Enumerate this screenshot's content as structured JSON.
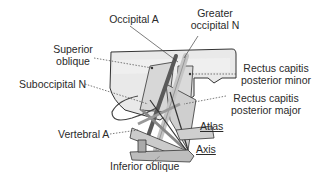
{
  "figure": {
    "type": "anatomical-diagram"
  },
  "labels": {
    "occipital_a": "Occipital A",
    "greater_occipital_n_line1": "Greater",
    "greater_occipital_n_line2": "occipital N",
    "superior_oblique_line1": "Superior",
    "superior_oblique_line2": "oblique",
    "suboccipital_n": "Suboccipital N",
    "rectus_minor_line1": "Rectus capitis",
    "rectus_minor_line2": "posterior minor",
    "rectus_major_line1": "Rectus capitis",
    "rectus_major_line2": "posterior major",
    "atlas": "Atlas",
    "axis": "Axis",
    "vertebral_a": "Vertebral A",
    "inferior_oblique": "Inferior oblique"
  },
  "colors": {
    "text": "#2a2a2a",
    "outline": "#333333",
    "skull_fill": "#e6e6e6",
    "bone_fill": "#bdbdbd",
    "nerve_light": "#c8c8c8",
    "vessel_dark": "#5a5a5a",
    "muscle_mid": "#8c8c8c"
  }
}
